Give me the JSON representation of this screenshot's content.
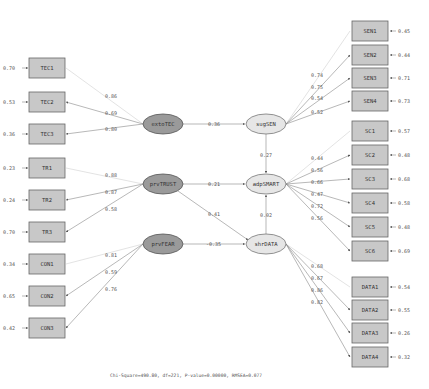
{
  "diagram": {
    "type": "structural-equation-model-path-diagram",
    "colors": {
      "exogenous_fill": "#9a9a9a",
      "endogenous_fill": "#e6e6e6",
      "indicator_fill": "#c8c8c8",
      "line": "#888888"
    },
    "exogenous": [
      {
        "name": "extoTEC",
        "indicators": [
          {
            "label": "TEC1",
            "loading": "0.86",
            "error": "0.70"
          },
          {
            "label": "TEC2",
            "loading": "0.69",
            "error": "0.53"
          },
          {
            "label": "TEC3",
            "loading": "0.80",
            "error": "0.36"
          }
        ]
      },
      {
        "name": "prvTRUST",
        "indicators": [
          {
            "label": "TR1",
            "loading": "0.88",
            "error": "0.23"
          },
          {
            "label": "TR2",
            "loading": "0.87",
            "error": "0.24"
          },
          {
            "label": "TR3",
            "loading": "0.58",
            "error": "0.70"
          }
        ]
      },
      {
        "name": "prvFEAR",
        "indicators": [
          {
            "label": "CON1",
            "loading": "0.81",
            "error": "0.34"
          },
          {
            "label": "CON2",
            "loading": "0.59",
            "error": "0.65"
          },
          {
            "label": "CON3",
            "loading": "0.76",
            "error": "0.42"
          }
        ]
      }
    ],
    "endogenous": [
      {
        "name": "sugSEN",
        "indicators": [
          {
            "label": "SEN1",
            "loading": "0.74",
            "error": "0.45"
          },
          {
            "label": "SEN2",
            "loading": "0.75",
            "error": "0.44"
          },
          {
            "label": "SEN3",
            "loading": "0.54",
            "error": "0.71"
          },
          {
            "label": "SEN4",
            "loading": "0.52",
            "error": "0.73"
          }
        ]
      },
      {
        "name": "adpSMART",
        "indicators": [
          {
            "label": "SC1",
            "loading": "0.44",
            "error": "0.57"
          },
          {
            "label": "SC2",
            "loading": "0.56",
            "error": "0.48"
          },
          {
            "label": "SC3",
            "loading": "0.66",
            "error": "0.68"
          },
          {
            "label": "SC4",
            "loading": "0.47",
            "error": "0.58"
          },
          {
            "label": "SC5",
            "loading": "0.72",
            "error": "0.48"
          },
          {
            "label": "SC6",
            "loading": "0.56",
            "error": "0.69"
          }
        ]
      },
      {
        "name": "shrDATA",
        "indicators": [
          {
            "label": "DATA1",
            "loading": "0.68",
            "error": "0.54"
          },
          {
            "label": "DATA2",
            "loading": "0.67",
            "error": "0.55"
          },
          {
            "label": "DATA3",
            "loading": "0.86",
            "error": "0.26"
          },
          {
            "label": "DATA4",
            "loading": "0.82",
            "error": "0.32"
          }
        ]
      }
    ],
    "paths": [
      {
        "from": "extoTEC",
        "to": "sugSEN",
        "coef": "0.36"
      },
      {
        "from": "sugSEN",
        "to": "adpSMART",
        "coef": "0.27"
      },
      {
        "from": "prvTRUST",
        "to": "adpSMART",
        "coef": "0.21"
      },
      {
        "from": "prvTRUST",
        "to": "shrDATA",
        "coef": "0.41"
      },
      {
        "from": "prvFEAR",
        "to": "shrDATA",
        "coef": "-0.35"
      },
      {
        "from": "shrDATA",
        "to": "adpSMART",
        "coef": "0.02"
      }
    ],
    "footer": "Chi-Square=490.80, df=221, P-value=0.00000, RMSEA=0.077"
  }
}
